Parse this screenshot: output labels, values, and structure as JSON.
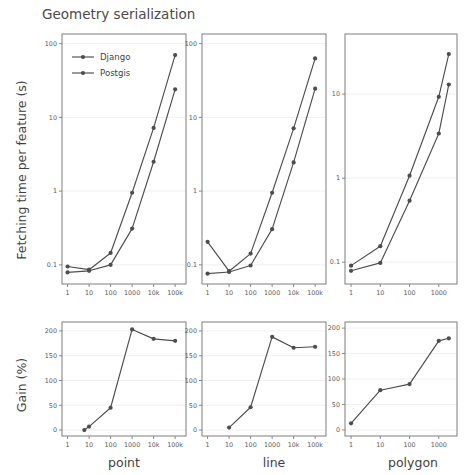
{
  "figure": {
    "title": "Geometry serialization",
    "background_color": "#ffffff",
    "line_color": "#4d4d4d",
    "grid_color": "#efecec",
    "axis_color": "#7d7d7d",
    "text_color": "#3f3f3f"
  },
  "legend": {
    "position": "upper-left-of-first-panel",
    "entries": [
      {
        "label": "Django",
        "color": "#4d4d4d",
        "marker": "circle"
      },
      {
        "label": "Postgis",
        "color": "#4d4d4d",
        "marker": "circle"
      }
    ]
  },
  "axis_titles": {
    "top_row_y": "Fetching time per feature (s)",
    "bottom_row_y": "Gain (%)",
    "columns": [
      "point",
      "line",
      "polygon"
    ]
  },
  "chart_data": [
    {
      "id": "point-time",
      "type": "line",
      "title": "",
      "column": "point",
      "row": "time",
      "xlabel": "point",
      "ylabel": "Fetching time per feature (s)",
      "xscale": "log",
      "yscale": "log",
      "xlim": [
        0.55,
        320000
      ],
      "ylim": [
        0.055,
        135
      ],
      "xticks": [
        1,
        10,
        100,
        1000,
        10000,
        100000
      ],
      "xticklabels": [
        "1",
        "10",
        "100",
        "1000",
        "10k",
        "100k"
      ],
      "yticks": [
        0.1,
        1,
        10,
        100
      ],
      "yticklabels": [
        "0.1",
        "1",
        "10",
        "100"
      ],
      "grid": true,
      "legend": true,
      "x": [
        1,
        10,
        100,
        1000,
        10000,
        100000
      ],
      "series": [
        {
          "name": "Django",
          "values": [
            0.095,
            0.086,
            0.145,
            0.95,
            7.2,
            70.0
          ]
        },
        {
          "name": "Postgis",
          "values": [
            0.079,
            0.083,
            0.1,
            0.31,
            2.5,
            24.0
          ]
        }
      ]
    },
    {
      "id": "line-time",
      "type": "line",
      "title": "",
      "column": "line",
      "row": "time",
      "xlabel": "line",
      "ylabel": "",
      "xscale": "log",
      "yscale": "log",
      "xlim": [
        0.55,
        320000
      ],
      "ylim": [
        0.055,
        135
      ],
      "xticks": [
        1,
        10,
        100,
        1000,
        10000,
        100000
      ],
      "xticklabels": [
        "1",
        "10",
        "100",
        "1000",
        "10k",
        "100k"
      ],
      "yticks": [
        0.1,
        1,
        10,
        100
      ],
      "yticklabels": [
        "0.1",
        "1",
        "10",
        "100"
      ],
      "grid": true,
      "legend": false,
      "x": [
        1,
        10,
        100,
        1000,
        10000,
        100000
      ],
      "series": [
        {
          "name": "Django",
          "values": [
            0.205,
            0.082,
            0.142,
            0.95,
            7.1,
            63.0
          ]
        },
        {
          "name": "Postgis",
          "values": [
            0.076,
            0.08,
            0.098,
            0.305,
            2.45,
            24.5
          ]
        }
      ]
    },
    {
      "id": "polygon-time",
      "type": "line",
      "title": "",
      "column": "polygon",
      "row": "time",
      "xlabel": "polygon",
      "ylabel": "",
      "xscale": "log",
      "yscale": "log",
      "xlim": [
        0.62,
        4200
      ],
      "ylim": [
        0.055,
        52
      ],
      "xticks": [
        1,
        10,
        100,
        1000
      ],
      "xticklabels": [
        "1",
        "10",
        "100",
        "1000"
      ],
      "yticks": [
        0.1,
        1,
        10
      ],
      "yticklabels": [
        "0.1",
        "1",
        "10"
      ],
      "grid": true,
      "legend": false,
      "x": [
        1,
        10,
        100,
        1000,
        2200
      ],
      "series": [
        {
          "name": "Django",
          "values": [
            0.091,
            0.155,
            1.07,
            9.3,
            30.0
          ]
        },
        {
          "name": "Postgis",
          "values": [
            0.079,
            0.098,
            0.54,
            3.4,
            13.0
          ]
        }
      ]
    },
    {
      "id": "point-gain",
      "type": "line",
      "title": "",
      "column": "point",
      "row": "gain",
      "xlabel": "point",
      "ylabel": "Gain (%)",
      "xscale": "log",
      "yscale": "linear",
      "xlim": [
        0.55,
        320000
      ],
      "ylim": [
        -12,
        218
      ],
      "xticks": [
        1,
        10,
        100,
        1000,
        10000,
        100000
      ],
      "xticklabels": [
        "1",
        "10",
        "100",
        "1000",
        "10k",
        "100k"
      ],
      "yticks": [
        0,
        50,
        100,
        150,
        200
      ],
      "yticklabels": [
        "0",
        "50",
        "100",
        "150",
        "200"
      ],
      "grid": true,
      "legend": false,
      "x": [
        6,
        10,
        100,
        1000,
        10000,
        100000
      ],
      "series": [
        {
          "name": "Gain",
          "values": [
            0,
            7,
            45,
            203,
            184,
            180
          ]
        }
      ]
    },
    {
      "id": "line-gain",
      "type": "line",
      "title": "",
      "column": "line",
      "row": "gain",
      "xlabel": "line",
      "ylabel": "",
      "xscale": "log",
      "yscale": "linear",
      "xlim": [
        0.55,
        320000
      ],
      "ylim": [
        -12,
        218
      ],
      "xticks": [
        1,
        10,
        100,
        1000,
        10000,
        100000
      ],
      "xticklabels": [
        "1",
        "10",
        "100",
        "1000",
        "10k",
        "100k"
      ],
      "yticks": [
        0,
        50,
        100,
        150,
        200
      ],
      "yticklabels": [
        "0",
        "50",
        "100",
        "150",
        "200"
      ],
      "grid": true,
      "legend": false,
      "x": [
        10,
        100,
        1000,
        10000,
        100000
      ],
      "series": [
        {
          "name": "Gain",
          "values": [
            5,
            46,
            188,
            166,
            168
          ]
        }
      ]
    },
    {
      "id": "polygon-gain",
      "type": "line",
      "title": "",
      "column": "polygon",
      "row": "gain",
      "xlabel": "polygon",
      "ylabel": "",
      "xscale": "log",
      "yscale": "linear",
      "xlim": [
        0.62,
        4200
      ],
      "ylim": [
        -12,
        212
      ],
      "xticks": [
        1,
        10,
        100,
        1000
      ],
      "xticklabels": [
        "1",
        "10",
        "100",
        "1000"
      ],
      "yticks": [
        0,
        50,
        100,
        150,
        200
      ],
      "yticklabels": [
        "0",
        "50",
        "100",
        "150",
        "200"
      ],
      "grid": true,
      "legend": false,
      "x": [
        1,
        10,
        100,
        1000,
        2200
      ],
      "series": [
        {
          "name": "Gain",
          "values": [
            13,
            78,
            90,
            175,
            180
          ]
        }
      ]
    }
  ]
}
